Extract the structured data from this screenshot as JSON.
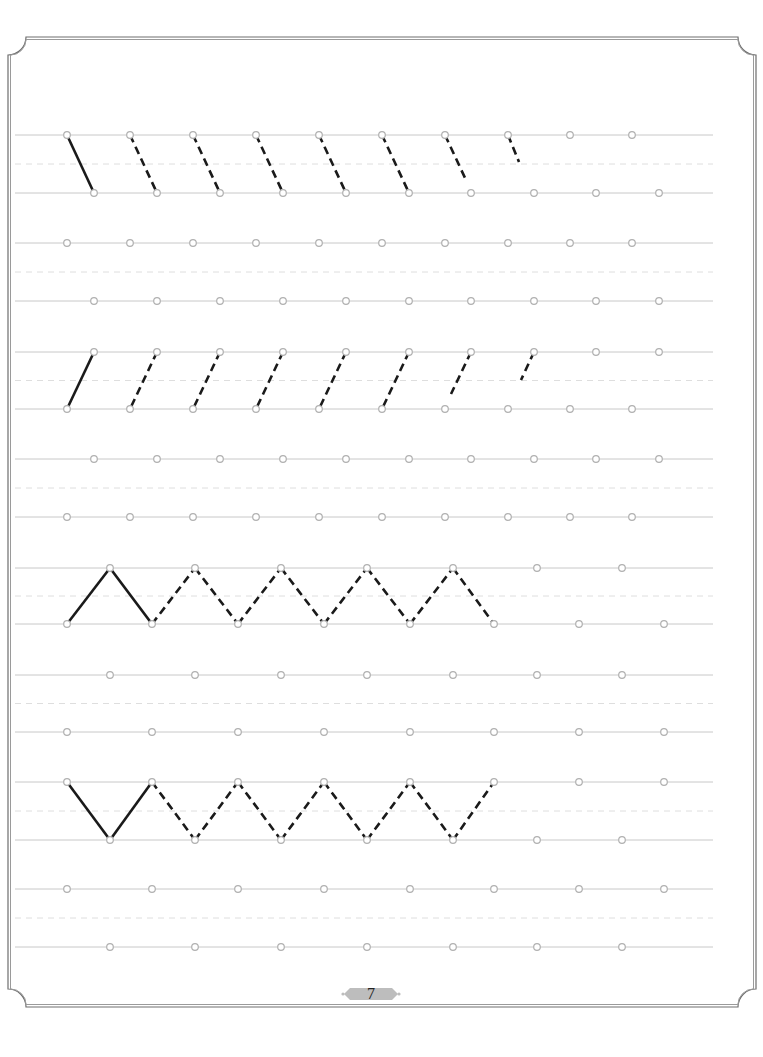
{
  "page": {
    "number": "7",
    "background": "#ffffff",
    "colors": {
      "frame": "#6e6e6e",
      "guide_line": "#c8c8c8",
      "mid_dash": "#dedede",
      "dot_stroke": "#b0b0b0",
      "stroke_solid": "#1a1a1a",
      "banner": "#bdbdbd"
    }
  },
  "guides": {
    "x_start": 15,
    "x_end": 713,
    "pairs": [
      {
        "top": 135,
        "bottom": 193
      },
      {
        "top": 243,
        "bottom": 301
      },
      {
        "top": 352,
        "bottom": 409
      },
      {
        "top": 459,
        "bottom": 517
      },
      {
        "top": 568,
        "bottom": 624
      },
      {
        "top": 675,
        "bottom": 732
      },
      {
        "top": 782,
        "bottom": 840
      },
      {
        "top": 889,
        "bottom": 947
      }
    ]
  },
  "exercises": [
    {
      "name": "backslash-strokes",
      "pair": 0,
      "dots_top": [
        67,
        130,
        193,
        256,
        319,
        382,
        445,
        508,
        570,
        632
      ],
      "dots_bottom": [
        94,
        157,
        220,
        283,
        346,
        409,
        471,
        534,
        596,
        659
      ],
      "strokes": [
        {
          "x1": 67,
          "y1": 135,
          "x2": 94,
          "y2": 193,
          "style": "solid"
        },
        {
          "x1": 130,
          "y1": 135,
          "x2": 157,
          "y2": 193,
          "style": "dashed"
        },
        {
          "x1": 193,
          "y1": 135,
          "x2": 220,
          "y2": 193,
          "style": "dashed"
        },
        {
          "x1": 256,
          "y1": 135,
          "x2": 283,
          "y2": 193,
          "style": "dashed"
        },
        {
          "x1": 319,
          "y1": 135,
          "x2": 346,
          "y2": 193,
          "style": "dashed"
        },
        {
          "x1": 382,
          "y1": 135,
          "x2": 409,
          "y2": 193,
          "style": "dashed"
        },
        {
          "x1": 445,
          "y1": 135,
          "x2": 466,
          "y2": 180,
          "style": "dashed"
        },
        {
          "x1": 508,
          "y1": 135,
          "x2": 519,
          "y2": 162,
          "style": "dashed"
        }
      ]
    },
    {
      "name": "practice-empty-1",
      "pair": 1,
      "dots_top": [
        67,
        130,
        193,
        256,
        319,
        382,
        445,
        508,
        570,
        632
      ],
      "dots_bottom": [
        94,
        157,
        220,
        283,
        346,
        409,
        471,
        534,
        596,
        659
      ],
      "strokes": []
    },
    {
      "name": "slash-strokes",
      "pair": 2,
      "dots_top": [
        94,
        157,
        220,
        283,
        346,
        409,
        471,
        534,
        596,
        659
      ],
      "dots_bottom": [
        67,
        130,
        193,
        256,
        319,
        382,
        445,
        508,
        570,
        632
      ],
      "strokes": [
        {
          "x1": 94,
          "y1": 352,
          "x2": 67,
          "y2": 409,
          "style": "solid"
        },
        {
          "x1": 157,
          "y1": 352,
          "x2": 130,
          "y2": 409,
          "style": "dashed"
        },
        {
          "x1": 220,
          "y1": 352,
          "x2": 193,
          "y2": 409,
          "style": "dashed"
        },
        {
          "x1": 283,
          "y1": 352,
          "x2": 256,
          "y2": 409,
          "style": "dashed"
        },
        {
          "x1": 346,
          "y1": 352,
          "x2": 319,
          "y2": 409,
          "style": "dashed"
        },
        {
          "x1": 409,
          "y1": 352,
          "x2": 382,
          "y2": 409,
          "style": "dashed"
        },
        {
          "x1": 471,
          "y1": 352,
          "x2": 451,
          "y2": 394,
          "style": "dashed"
        },
        {
          "x1": 534,
          "y1": 352,
          "x2": 521,
          "y2": 380,
          "style": "dashed"
        }
      ]
    },
    {
      "name": "practice-empty-2",
      "pair": 3,
      "dots_top": [
        94,
        157,
        220,
        283,
        346,
        409,
        471,
        534,
        596,
        659
      ],
      "dots_bottom": [
        67,
        130,
        193,
        256,
        319,
        382,
        445,
        508,
        570,
        632
      ],
      "strokes": []
    },
    {
      "name": "zigzag-peaks",
      "pair": 4,
      "dots_top": [
        110,
        195,
        281,
        367,
        453,
        537,
        622
      ],
      "dots_bottom": [
        67,
        152,
        238,
        324,
        410,
        494,
        579,
        664
      ],
      "strokes": [
        {
          "x1": 67,
          "y1": 624,
          "x2": 110,
          "y2": 568,
          "style": "solid"
        },
        {
          "x1": 110,
          "y1": 568,
          "x2": 152,
          "y2": 624,
          "style": "solid"
        },
        {
          "x1": 152,
          "y1": 624,
          "x2": 195,
          "y2": 568,
          "style": "dashed"
        },
        {
          "x1": 195,
          "y1": 568,
          "x2": 238,
          "y2": 624,
          "style": "dashed"
        },
        {
          "x1": 238,
          "y1": 624,
          "x2": 281,
          "y2": 568,
          "style": "dashed"
        },
        {
          "x1": 281,
          "y1": 568,
          "x2": 324,
          "y2": 624,
          "style": "dashed"
        },
        {
          "x1": 324,
          "y1": 624,
          "x2": 367,
          "y2": 568,
          "style": "dashed"
        },
        {
          "x1": 367,
          "y1": 568,
          "x2": 410,
          "y2": 624,
          "style": "dashed"
        },
        {
          "x1": 410,
          "y1": 624,
          "x2": 453,
          "y2": 568,
          "style": "dashed"
        },
        {
          "x1": 453,
          "y1": 568,
          "x2": 494,
          "y2": 624,
          "style": "dashed"
        }
      ]
    },
    {
      "name": "practice-empty-3",
      "pair": 5,
      "dots_top": [
        110,
        195,
        281,
        367,
        453,
        537,
        622
      ],
      "dots_bottom": [
        67,
        152,
        238,
        324,
        410,
        494,
        579,
        664
      ],
      "strokes": []
    },
    {
      "name": "zigzag-valleys",
      "pair": 6,
      "dots_top": [
        67,
        152,
        238,
        324,
        410,
        494,
        579,
        664
      ],
      "dots_bottom": [
        110,
        195,
        281,
        367,
        453,
        537,
        622
      ],
      "strokes": [
        {
          "x1": 67,
          "y1": 782,
          "x2": 110,
          "y2": 840,
          "style": "solid"
        },
        {
          "x1": 110,
          "y1": 840,
          "x2": 152,
          "y2": 782,
          "style": "solid"
        },
        {
          "x1": 152,
          "y1": 782,
          "x2": 195,
          "y2": 840,
          "style": "dashed"
        },
        {
          "x1": 195,
          "y1": 840,
          "x2": 238,
          "y2": 782,
          "style": "dashed"
        },
        {
          "x1": 238,
          "y1": 782,
          "x2": 281,
          "y2": 840,
          "style": "dashed"
        },
        {
          "x1": 281,
          "y1": 840,
          "x2": 324,
          "y2": 782,
          "style": "dashed"
        },
        {
          "x1": 324,
          "y1": 782,
          "x2": 367,
          "y2": 840,
          "style": "dashed"
        },
        {
          "x1": 367,
          "y1": 840,
          "x2": 410,
          "y2": 782,
          "style": "dashed"
        },
        {
          "x1": 410,
          "y1": 782,
          "x2": 453,
          "y2": 840,
          "style": "dashed"
        },
        {
          "x1": 453,
          "y1": 840,
          "x2": 494,
          "y2": 782,
          "style": "dashed"
        }
      ]
    },
    {
      "name": "practice-empty-4",
      "pair": 7,
      "dots_top": [
        67,
        152,
        238,
        324,
        410,
        494,
        579,
        664
      ],
      "dots_bottom": [
        110,
        195,
        281,
        367,
        453,
        537,
        622
      ],
      "strokes": []
    }
  ]
}
